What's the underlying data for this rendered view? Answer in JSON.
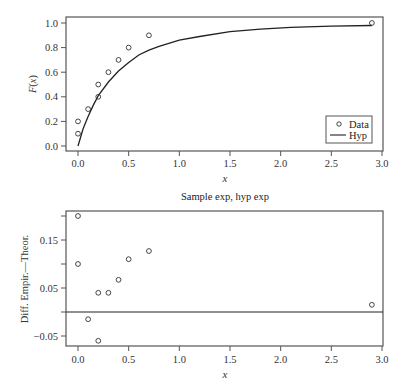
{
  "chart_data": [
    {
      "type": "scatter",
      "title": "",
      "xlabel": "x",
      "ylabel": "F(x)",
      "xlim": [
        0.0,
        3.0
      ],
      "ylim": [
        0.0,
        1.0
      ],
      "xticks": [
        "0.0",
        "0.5",
        "1.0",
        "1.5",
        "2.0",
        "2.5",
        "3.0"
      ],
      "yticks": [
        "0.0",
        "0.2",
        "0.4",
        "0.6",
        "0.8",
        "1.0"
      ],
      "grid": false,
      "legend_position": "bottom-right",
      "series": [
        {
          "name": "Data",
          "kind": "points",
          "x": [
            0.0,
            0.0,
            0.1,
            0.2,
            0.2,
            0.3,
            0.4,
            0.5,
            0.7,
            2.9
          ],
          "y": [
            0.1,
            0.2,
            0.3,
            0.4,
            0.5,
            0.6,
            0.7,
            0.8,
            0.9,
            1.0
          ]
        },
        {
          "name": "Hyp",
          "kind": "line",
          "x": [
            0.0,
            0.05,
            0.1,
            0.15,
            0.2,
            0.3,
            0.4,
            0.5,
            0.6,
            0.7,
            0.8,
            1.0,
            1.2,
            1.5,
            1.8,
            2.1,
            2.5,
            2.9
          ],
          "y": [
            0.0,
            0.14,
            0.24,
            0.33,
            0.41,
            0.52,
            0.61,
            0.68,
            0.74,
            0.78,
            0.81,
            0.86,
            0.89,
            0.93,
            0.95,
            0.965,
            0.975,
            0.98
          ]
        }
      ]
    },
    {
      "type": "scatter",
      "title": "Sample exp, hyp exp",
      "xlabel": "x",
      "ylabel": "Diff. Empir.—Theor.",
      "xlim": [
        0.0,
        3.0
      ],
      "ylim": [
        -0.065,
        0.21
      ],
      "xticks": [
        "0.0",
        "0.5",
        "1.0",
        "1.5",
        "2.0",
        "2.5",
        "3.0"
      ],
      "yticks": [
        "-0.05",
        "0.05",
        "0.15"
      ],
      "minor_yticks": [
        0.0,
        0.1,
        0.2
      ],
      "grid": false,
      "reference_line": 0.0,
      "series": [
        {
          "name": "Difference",
          "kind": "points",
          "x": [
            0.0,
            0.0,
            0.1,
            0.2,
            0.2,
            0.3,
            0.4,
            0.5,
            0.7,
            2.9
          ],
          "y": [
            0.2,
            0.1,
            -0.015,
            -0.06,
            0.04,
            0.04,
            0.067,
            0.11,
            0.127,
            0.015
          ]
        }
      ]
    }
  ],
  "labels": {
    "top_ylabel": "F(x)",
    "top_xlabel": "x",
    "bottom_title": "Sample exp, hyp exp",
    "bottom_ylabel": "Diff. Empir.—Theor.",
    "bottom_xlabel": "x",
    "legend_data": "Data",
    "legend_hyp": "Hyp"
  }
}
